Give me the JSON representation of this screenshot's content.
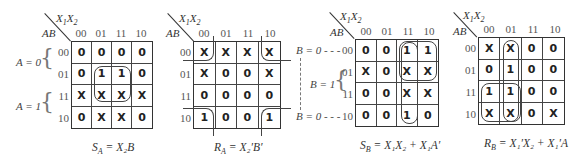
{
  "col_var": "X1X2",
  "row_var": "AB",
  "col_labels": [
    "00",
    "01",
    "11",
    "10"
  ],
  "row_labels": [
    "00",
    "01",
    "11",
    "10"
  ],
  "maps": [
    {
      "id": "SA",
      "cells": [
        [
          "0",
          "0",
          "0",
          "0"
        ],
        [
          "0",
          "1",
          "1",
          "0"
        ],
        [
          "X",
          "X",
          "X",
          "X"
        ],
        [
          "0",
          "X",
          "X",
          "0"
        ]
      ],
      "equation": {
        "lhs": "S",
        "lhs_sub": "A",
        "rhs": "X₂B"
      },
      "side_labels": [
        "A = 0",
        "A = 1"
      ]
    },
    {
      "id": "RA",
      "cells": [
        [
          "X",
          "X",
          "X",
          "X"
        ],
        [
          "X",
          "0",
          "0",
          "X"
        ],
        [
          "0",
          "0",
          "0",
          "0"
        ],
        [
          "1",
          "0",
          "0",
          "1"
        ]
      ],
      "equation": {
        "lhs": "R",
        "lhs_sub": "A",
        "rhs": "X₂′B′"
      }
    },
    {
      "id": "SB",
      "cells": [
        [
          "0",
          "0",
          "1",
          "1"
        ],
        [
          "X",
          "0",
          "X",
          "X"
        ],
        [
          "0",
          "0",
          "X",
          "X"
        ],
        [
          "0",
          "0",
          "1",
          "0"
        ]
      ],
      "equation": {
        "lhs": "S",
        "lhs_sub": "B",
        "rhs": "X₁X₂ + X₁A′"
      },
      "side_labels": [
        "B = 0 - - -",
        "B = 1",
        "B = 0 - - -"
      ]
    },
    {
      "id": "RB",
      "cells": [
        [
          "X",
          "X",
          "0",
          "0"
        ],
        [
          "0",
          "1",
          "0",
          "0"
        ],
        [
          "1",
          "1",
          "0",
          "0"
        ],
        [
          "X",
          "X",
          "0",
          "X"
        ]
      ],
      "equation": {
        "lhs": "R",
        "lhs_sub": "B",
        "rhs": "X₁′X₂ + X₁′A"
      }
    }
  ]
}
